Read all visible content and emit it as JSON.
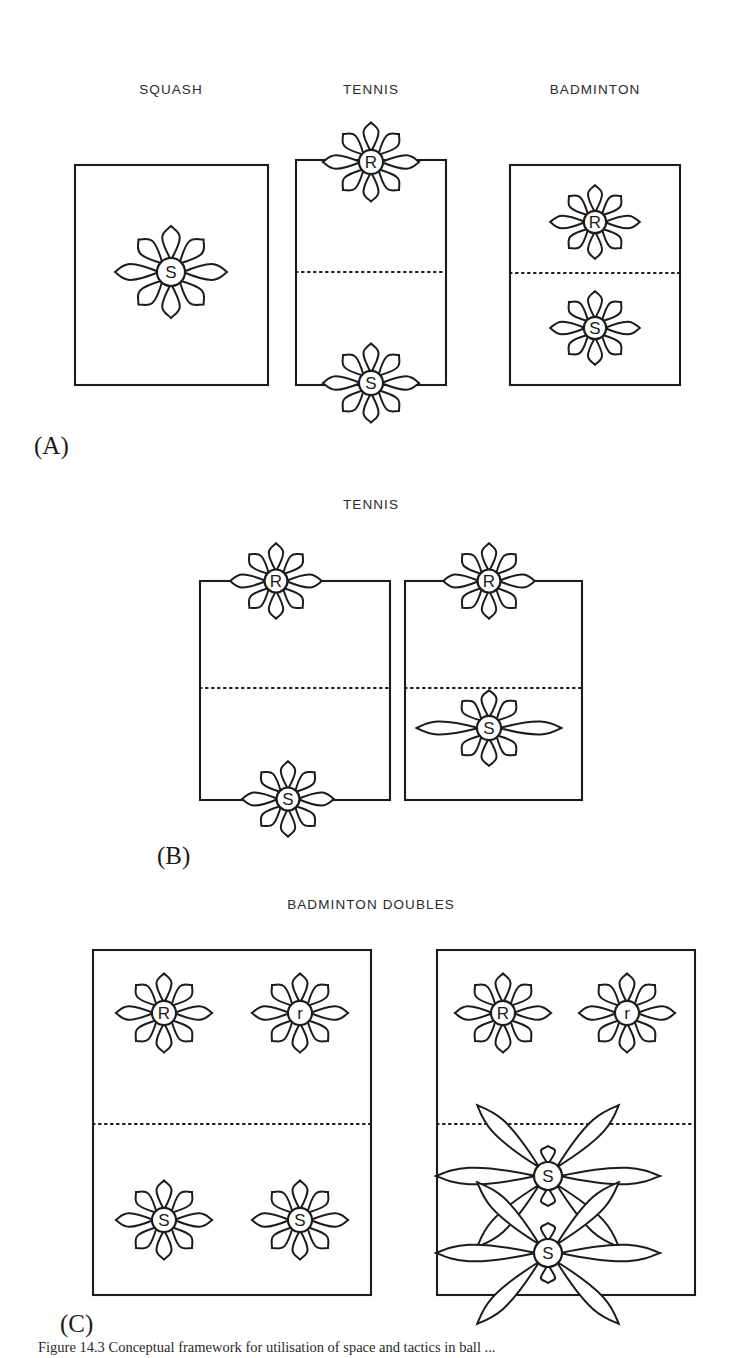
{
  "figure": {
    "caption": "Figure 14.3  Conceptual framework for utilisation of space and tactics in ball ...",
    "background_color": "#ffffff",
    "ink_color": "#1c1c1c"
  },
  "legend_keys": {
    "R": "receiver",
    "r": "receiver-partner",
    "S": "server",
    "s": "server-partner"
  },
  "sections": [
    {
      "id": "A",
      "label": "(A)",
      "label_x": 34,
      "label_y": 432,
      "panels": [
        {
          "name": "squash",
          "title": "SQUASH",
          "title_x": 171,
          "title_y": 82,
          "court": {
            "x": 75,
            "y": 165,
            "w": 193,
            "h": 220
          },
          "net": null,
          "players": [
            {
              "mark": "S",
              "cx": 171,
              "cy": 272,
              "style": "round",
              "scale": 1.0
            }
          ]
        },
        {
          "name": "tennis",
          "title": "TENNIS",
          "title_x": 371,
          "title_y": 82,
          "court": {
            "x": 296,
            "y": 160,
            "w": 150,
            "h": 225
          },
          "net": {
            "y": 272
          },
          "players": [
            {
              "mark": "R",
              "cx": 371,
              "cy": 162,
              "style": "round",
              "scale": 0.86
            },
            {
              "mark": "S",
              "cx": 371,
              "cy": 383,
              "style": "round",
              "scale": 0.86
            }
          ]
        },
        {
          "name": "badminton",
          "title": "BADMINTON",
          "title_x": 595,
          "title_y": 82,
          "court": {
            "x": 510,
            "y": 165,
            "w": 170,
            "h": 220
          },
          "net": {
            "y": 273
          },
          "players": [
            {
              "mark": "R",
              "cx": 595,
              "cy": 222,
              "style": "round",
              "scale": 0.8
            },
            {
              "mark": "S",
              "cx": 595,
              "cy": 328,
              "style": "round",
              "scale": 0.8
            }
          ]
        }
      ]
    },
    {
      "id": "B",
      "label": "(B)",
      "label_x": 157,
      "label_y": 842,
      "panels": [
        {
          "name": "tennis-left",
          "title": "TENNIS",
          "title_x": 371,
          "title_y": 497,
          "court": {
            "x": 200,
            "y": 581,
            "w": 190,
            "h": 219
          },
          "net": {
            "y": 688
          },
          "players": [
            {
              "mark": "R",
              "cx": 276,
              "cy": 581,
              "style": "round",
              "scale": 0.82
            },
            {
              "mark": "S",
              "cx": 288,
              "cy": 799,
              "style": "round",
              "scale": 0.82
            }
          ]
        },
        {
          "name": "tennis-right",
          "title": null,
          "title_x": null,
          "title_y": null,
          "court": {
            "x": 405,
            "y": 581,
            "w": 177,
            "h": 219
          },
          "net": {
            "y": 688
          },
          "players": [
            {
              "mark": "R",
              "cx": 489,
              "cy": 581,
              "style": "round",
              "scale": 0.82
            },
            {
              "mark": "S",
              "cx": 489,
              "cy": 728,
              "style": "wide",
              "scale": 0.86
            }
          ]
        }
      ]
    },
    {
      "id": "C",
      "label": "(C)",
      "label_x": 60,
      "label_y": 1310,
      "panels": [
        {
          "name": "badminton-doubles-left",
          "title": "BADMINTON DOUBLES",
          "title_x": 371,
          "title_y": 897,
          "court": {
            "x": 93,
            "y": 950,
            "w": 278,
            "h": 345
          },
          "net": {
            "y": 1124
          },
          "players": [
            {
              "mark": "R",
              "cx": 164,
              "cy": 1013,
              "style": "round",
              "scale": 0.86
            },
            {
              "mark": "r",
              "cx": 300,
              "cy": 1013,
              "style": "round",
              "scale": 0.86
            },
            {
              "mark": "S",
              "cx": 164,
              "cy": 1220,
              "style": "round",
              "scale": 0.86
            },
            {
              "mark": "S",
              "cx": 300,
              "cy": 1220,
              "style": "round",
              "scale": 0.86
            }
          ]
        },
        {
          "name": "badminton-doubles-right",
          "title": null,
          "title_x": null,
          "title_y": null,
          "court": {
            "x": 437,
            "y": 950,
            "w": 258,
            "h": 345
          },
          "net": {
            "y": 1124
          },
          "players": [
            {
              "mark": "R",
              "cx": 503,
              "cy": 1013,
              "style": "round",
              "scale": 0.86
            },
            {
              "mark": "r",
              "cx": 627,
              "cy": 1013,
              "style": "round",
              "scale": 0.86
            },
            {
              "mark": "S",
              "cx": 548,
              "cy": 1176,
              "style": "stretched",
              "scale": 1.0
            },
            {
              "mark": "S",
              "cx": 548,
              "cy": 1253,
              "style": "stretched",
              "scale": 1.0
            }
          ]
        }
      ]
    }
  ]
}
